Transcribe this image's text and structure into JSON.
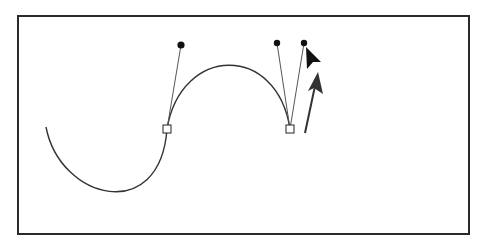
{
  "canvas": {
    "background": "#ffffff",
    "frame_color": "#2a2a2a",
    "stroke_color": "#333333"
  },
  "path": {
    "description": "Bezier curve being edited with pen tool",
    "segments": [
      {
        "from": [
          46,
          127
        ],
        "c1": [
          60,
          200
        ],
        "c2": [
          160,
          225
        ],
        "to": [
          167,
          129
        ]
      },
      {
        "from": [
          167,
          129
        ],
        "c1": [
          181,
          45
        ],
        "c2": [
          277,
          43
        ],
        "to": [
          290,
          129
        ]
      }
    ]
  },
  "anchors": [
    {
      "name": "anchor-1",
      "x": 167,
      "y": 129
    },
    {
      "name": "anchor-2",
      "x": 290,
      "y": 129
    }
  ],
  "handles": [
    {
      "name": "handle-1-out",
      "anchor": 0,
      "x": 181,
      "y": 45
    },
    {
      "name": "handle-2-in",
      "anchor": 1,
      "x": 277,
      "y": 43
    },
    {
      "name": "handle-2-out",
      "anchor": 1,
      "x": 304,
      "y": 43
    }
  ],
  "cursor": {
    "icon": "arrow-pointer-icon",
    "x": 306,
    "y": 47
  },
  "drag_indicator": {
    "icon": "drag-direction-arrow-icon",
    "from": [
      305,
      133
    ],
    "to": [
      318,
      72
    ]
  }
}
